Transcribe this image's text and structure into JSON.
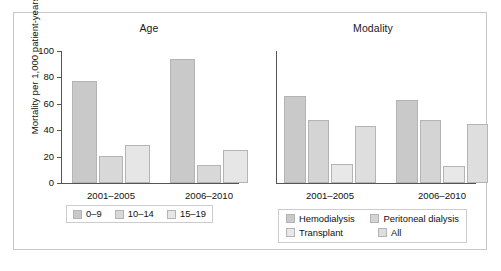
{
  "figure": {
    "y_axis_label": "Mortality per 1,000 patient-years"
  },
  "chart_data": [
    {
      "type": "bar",
      "title": "Age",
      "xlabel": "",
      "ylabel": "Mortality per 1,000 patient-years",
      "ylim": [
        0,
        100
      ],
      "yticks": [
        0,
        20,
        40,
        60,
        80,
        100
      ],
      "grid": false,
      "legend_position": "bottom",
      "categories": [
        "2001–2005",
        "2006–2010"
      ],
      "series": [
        {
          "name": "0–9",
          "values": [
            77.5,
            94
          ],
          "color": "#c9c9c9"
        },
        {
          "name": "10–14",
          "values": [
            20.5,
            14
          ],
          "color": "#d8d8d8"
        },
        {
          "name": "15–19",
          "values": [
            28.5,
            25
          ],
          "color": "#e6e6e6"
        }
      ]
    },
    {
      "type": "bar",
      "title": "Modality",
      "xlabel": "",
      "ylabel": "",
      "ylim": [
        0,
        100
      ],
      "yticks": [],
      "grid": false,
      "legend_position": "bottom",
      "categories": [
        "2001–2005",
        "2006–2010"
      ],
      "series": [
        {
          "name": "Hemodialysis",
          "values": [
            66,
            63
          ],
          "color": "#c9c9c9"
        },
        {
          "name": "Peritoneal dialysis",
          "values": [
            47.5,
            48
          ],
          "color": "#d4d4d4"
        },
        {
          "name": "Transplant",
          "values": [
            14.5,
            13
          ],
          "color": "#e8e8e8"
        },
        {
          "name": "All",
          "values": [
            43,
            44.5
          ],
          "color": "#dedede"
        }
      ]
    }
  ],
  "age_panel": {
    "title": "Age",
    "yticks": [
      "0",
      "20",
      "40",
      "60",
      "80",
      "100"
    ],
    "xticks": [
      "2001–2005",
      "2006–2010"
    ],
    "legend": [
      "0–9",
      "10–14",
      "15–19"
    ]
  },
  "modality_panel": {
    "title": "Modality",
    "xticks": [
      "2001–2005",
      "2006–2010"
    ],
    "legend": [
      "Hemodialysis",
      "Peritoneal dialysis",
      "Transplant",
      "All"
    ]
  }
}
